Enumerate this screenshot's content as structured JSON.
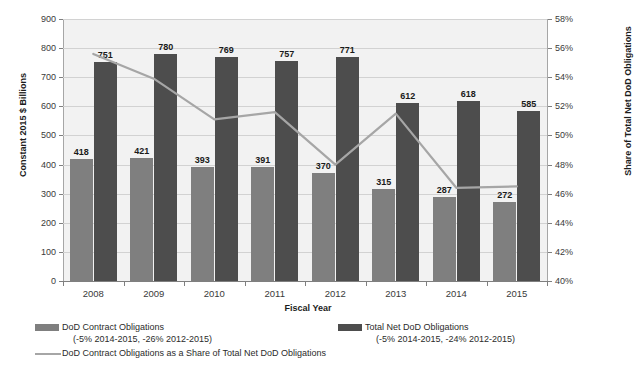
{
  "chart_data": {
    "type": "bar",
    "title": "",
    "xlabel": "Fiscal Year",
    "ylabel": "Constant 2015 $ Billions",
    "ylabel_right": "Share of Total Net DoD Obligations",
    "categories": [
      "2008",
      "2009",
      "2010",
      "2011",
      "2012",
      "2013",
      "2014",
      "2015"
    ],
    "ylim": [
      0,
      900
    ],
    "ylim_right": [
      40,
      58
    ],
    "yticks": [
      "0",
      "100",
      "200",
      "300",
      "400",
      "500",
      "600",
      "700",
      "800",
      "900"
    ],
    "yticks_right": [
      "40%",
      "42%",
      "44%",
      "46%",
      "48%",
      "50%",
      "52%",
      "54%",
      "56%",
      "58%"
    ],
    "grid": true,
    "legend_position": "bottom",
    "series": [
      {
        "name": "DoD Contract Obligations",
        "sub": "(-5% 2014-2015, -26% 2012-2015)",
        "type": "bar",
        "axis": "left",
        "color": "#7f7f7f",
        "values": [
          418,
          421,
          393,
          391,
          370,
          315,
          287,
          272
        ]
      },
      {
        "name": "Total Net DoD Obligations",
        "sub": "(-5% 2014-2015, -24% 2012-2015)",
        "type": "bar",
        "axis": "left",
        "color": "#4d4d4d",
        "values": [
          751,
          780,
          769,
          757,
          771,
          612,
          618,
          585
        ]
      },
      {
        "name": "DoD Contract Obligations as a Share of Total Net DoD Obligations",
        "sub": "",
        "type": "line",
        "axis": "right",
        "color": "#a6a6a6",
        "values": [
          55.6,
          53.9,
          51.1,
          51.6,
          48.0,
          51.5,
          46.4,
          46.5
        ]
      }
    ]
  },
  "axes": {
    "left_title": "Constant 2015 $ Billions",
    "right_title": "Share of Total Net DoD Obligations",
    "x_title": "Fiscal Year"
  },
  "legend": {
    "item1_label": "DoD Contract Obligations",
    "item1_sub": "(-5% 2014-2015, -26% 2012-2015)",
    "item2_label": "Total Net DoD Obligations",
    "item2_sub": "(-5% 2014-2015, -24% 2012-2015)",
    "item3_label": "DoD Contract Obligations as a Share of Total Net DoD Obligations"
  },
  "colors": {
    "contract_bar": "#7f7f7f",
    "total_bar": "#4d4d4d",
    "share_line": "#a6a6a6",
    "plot_background": "#f2f2f2",
    "gridline": "#d2d2d2"
  }
}
